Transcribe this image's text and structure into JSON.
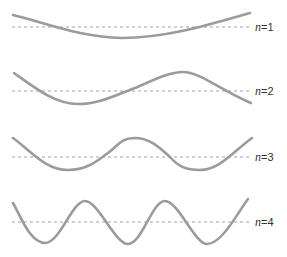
{
  "colors": {
    "wave": "#9b9b9b",
    "axis": "#8a8a8a",
    "label": "#333333",
    "background": "#ffffff"
  },
  "modes": [
    {
      "n": 1,
      "var": "n",
      "eq": "=",
      "value": "1",
      "label": "n = 1",
      "baseline_y": 27,
      "path": "M13,15 C50,24 80,37 122,38 C165,38 205,26 250,13"
    },
    {
      "n": 2,
      "var": "n",
      "eq": "=",
      "value": "2",
      "label": "n = 2",
      "baseline_y": 91,
      "path": "M14,73 C35,88 55,104 78,104 C100,104 118,94 135,88 C150,82 168,72 183,72 C200,72 220,90 251,103"
    },
    {
      "n": 3,
      "var": "n",
      "eq": "=",
      "value": "3",
      "label": "n = 3",
      "baseline_y": 157,
      "path": "M13,138 C30,150 45,170 68,170 C88,170 98,160 108,153 C118,146 120,138 135,138 C150,138 160,148 170,157 C178,166 185,170 200,170 C220,170 235,150 252,138"
    },
    {
      "n": 4,
      "var": "n",
      "eq": "=",
      "value": "4",
      "label": "n = 4",
      "baseline_y": 222,
      "path": "M13,203 C20,215 30,243 45,243 C60,243 72,201 85,201 C98,201 115,244 128,244 C142,244 152,201 165,201 C178,201 195,244 207,244 C222,244 238,212 248,199"
    }
  ]
}
